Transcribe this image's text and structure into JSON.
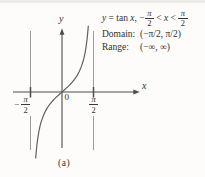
{
  "colors": {
    "background": "#fdfcfa",
    "ink": "#33312d",
    "axis": "#4c4c4c",
    "curve": "#606060",
    "asymptote": "#8f8f8f"
  },
  "header": {
    "equation": {
      "y": "y",
      "equals": " = ",
      "fn": "tan",
      "x1": " x",
      "comma": ", ",
      "minus": "−",
      "pi": "π",
      "two": "2",
      "lt1": " < ",
      "x2": "x",
      "lt2": " < "
    },
    "domain_label": "Domain:",
    "domain_value": "(−π/2, π/2)",
    "range_label": "Range:",
    "range_value": "(−∞, ∞)"
  },
  "graph": {
    "y_axis_label": "y",
    "x_axis_label": "x",
    "origin_label": "0",
    "tick_neg": {
      "minus": "−",
      "num": "π",
      "den": "2"
    },
    "tick_pos": {
      "num": "π",
      "den": "2"
    }
  },
  "caption": "(a)",
  "chart_data": {
    "type": "line",
    "function": "y = tan(x)",
    "xlabel": "x",
    "ylabel": "y",
    "x_domain": [
      -1.5708,
      1.5708
    ],
    "asymptotes_x": [
      -1.5708,
      1.5708
    ],
    "x_ticks": [
      {
        "value": -1.5708,
        "label": "-π/2"
      },
      {
        "value": 0,
        "label": "0"
      },
      {
        "value": 1.5708,
        "label": "π/2"
      }
    ],
    "domain": "(−π/2, π/2)",
    "range": "(−∞, ∞)",
    "grid": false,
    "legend": null,
    "points": [
      [
        -1.31,
        -3.747
      ],
      [
        -1.3,
        -3.602
      ],
      [
        -1.25,
        -3.01
      ],
      [
        -1.2,
        -2.572
      ],
      [
        -1.15,
        -2.234
      ],
      [
        -1.1,
        -1.965
      ],
      [
        -1.05,
        -1.743
      ],
      [
        -1.0,
        -1.557
      ],
      [
        -0.95,
        -1.398
      ],
      [
        -0.9,
        -1.26
      ],
      [
        -0.85,
        -1.138
      ],
      [
        -0.8,
        -1.03
      ],
      [
        -0.75,
        -0.932
      ],
      [
        -0.7,
        -0.842
      ],
      [
        -0.65,
        -0.76
      ],
      [
        -0.6,
        -0.684
      ],
      [
        -0.55,
        -0.613
      ],
      [
        -0.5,
        -0.546
      ],
      [
        -0.45,
        -0.483
      ],
      [
        -0.4,
        -0.423
      ],
      [
        -0.35,
        -0.365
      ],
      [
        -0.3,
        -0.309
      ],
      [
        -0.25,
        -0.255
      ],
      [
        -0.2,
        -0.203
      ],
      [
        -0.15,
        -0.151
      ],
      [
        -0.1,
        -0.1
      ],
      [
        -0.05,
        -0.05
      ],
      [
        0,
        0
      ],
      [
        0.05,
        0.05
      ],
      [
        0.1,
        0.1
      ],
      [
        0.15,
        0.151
      ],
      [
        0.2,
        0.203
      ],
      [
        0.25,
        0.255
      ],
      [
        0.3,
        0.309
      ],
      [
        0.35,
        0.365
      ],
      [
        0.4,
        0.423
      ],
      [
        0.45,
        0.483
      ],
      [
        0.5,
        0.546
      ],
      [
        0.55,
        0.613
      ],
      [
        0.6,
        0.684
      ],
      [
        0.65,
        0.76
      ],
      [
        0.7,
        0.842
      ],
      [
        0.75,
        0.932
      ],
      [
        0.8,
        1.03
      ],
      [
        0.85,
        1.138
      ],
      [
        0.9,
        1.26
      ],
      [
        0.95,
        1.398
      ],
      [
        1.0,
        1.557
      ],
      [
        1.05,
        1.743
      ],
      [
        1.1,
        1.965
      ],
      [
        1.15,
        2.234
      ],
      [
        1.2,
        2.572
      ],
      [
        1.25,
        3.01
      ],
      [
        1.3,
        3.602
      ],
      [
        1.31,
        3.747
      ]
    ]
  }
}
